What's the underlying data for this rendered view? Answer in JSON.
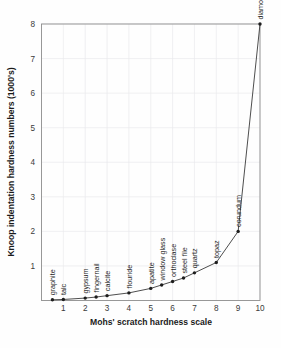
{
  "chart_data": {
    "type": "line",
    "title": "",
    "xlabel": "Mohs' scratch hardness scale",
    "ylabel": "Knoop indentation hardness numbers (1000's)",
    "xlim": [
      0,
      10
    ],
    "ylim": [
      0,
      8
    ],
    "xticks": [
      1,
      2,
      3,
      4,
      5,
      6,
      7,
      8,
      9,
      10
    ],
    "yticks": [
      1,
      2,
      3,
      4,
      5,
      6,
      7,
      8
    ],
    "grid": true,
    "legend": false,
    "units": "Knoop hardness in thousands",
    "line_color": "#3a3a3a",
    "marker_color": "#1d1d1d",
    "grid_color": "#e9e9ec",
    "points": [
      {
        "label": "graphite",
        "x": 0.5,
        "y": 0.02
      },
      {
        "label": "talc",
        "x": 1.0,
        "y": 0.03
      },
      {
        "label": "gypsum",
        "x": 2.0,
        "y": 0.07
      },
      {
        "label": "fingernail",
        "x": 2.5,
        "y": 0.1
      },
      {
        "label": "calcite",
        "x": 3.0,
        "y": 0.14
      },
      {
        "label": "flouride",
        "x": 4.0,
        "y": 0.22
      },
      {
        "label": "apatite",
        "x": 5.0,
        "y": 0.35
      },
      {
        "label": "window glass",
        "x": 5.5,
        "y": 0.45
      },
      {
        "label": "orthoclase",
        "x": 6.0,
        "y": 0.55
      },
      {
        "label": "steel file",
        "x": 6.5,
        "y": 0.65
      },
      {
        "label": "quartz",
        "x": 7.0,
        "y": 0.8
      },
      {
        "label": "topaz",
        "x": 8.0,
        "y": 1.1
      },
      {
        "label": "corundum",
        "x": 9.0,
        "y": 2.0
      },
      {
        "label": "diamond",
        "x": 10.0,
        "y": 8.0
      }
    ]
  },
  "axes": {
    "x_title": "Mohs' scratch hardness scale",
    "y_title": "Knoop indentation hardness numbers (1000's)",
    "x_tick_labels": [
      "1",
      "2",
      "3",
      "4",
      "5",
      "6",
      "7",
      "8",
      "9",
      "10"
    ],
    "y_tick_labels": [
      "1",
      "2",
      "3",
      "4",
      "5",
      "6",
      "7",
      "8"
    ]
  }
}
